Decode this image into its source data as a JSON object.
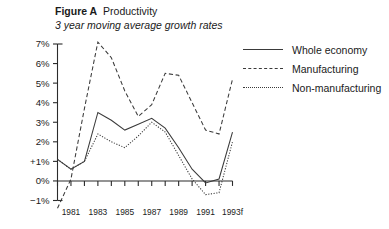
{
  "figure": {
    "label": "Figure A",
    "title": "Productivity",
    "subtitle": "3 year moving average growth rates"
  },
  "legend": [
    {
      "label": "Whole economy",
      "style": "solid"
    },
    {
      "label": "Manufacturing",
      "style": "dashed"
    },
    {
      "label": "Non-manufacturing",
      "style": "dotted"
    }
  ],
  "axes": {
    "y_ticks": [
      "7%",
      "6%",
      "5%",
      "4%",
      "3%",
      "2%",
      "+1%",
      "0%",
      "−1%"
    ],
    "x_ticks": [
      "1981",
      "1983",
      "1985",
      "1987",
      "1989",
      "1991",
      "1993f"
    ]
  },
  "chart_data": {
    "type": "line",
    "title": "Productivity",
    "subtitle": "3 year moving average growth rates",
    "xlabel": "",
    "ylabel": "",
    "ylim": [
      -1,
      7
    ],
    "xlim": [
      1980,
      1993
    ],
    "grid": false,
    "legend_position": "top-right",
    "yticks": [
      -1,
      0,
      1,
      2,
      3,
      4,
      5,
      6,
      7
    ],
    "ytick_labels": [
      "−1%",
      "0%",
      "+1%",
      "2%",
      "3%",
      "4%",
      "5%",
      "6%",
      "7%"
    ],
    "x": [
      1980,
      1981,
      1982,
      1983,
      1984,
      1985,
      1986,
      1987,
      1988,
      1989,
      1990,
      1991,
      1992,
      1993
    ],
    "xtick_values": [
      1981,
      1983,
      1985,
      1987,
      1989,
      1991,
      1993
    ],
    "xtick_labels": [
      "1981",
      "1983",
      "1985",
      "1987",
      "1989",
      "1991",
      "1993f"
    ],
    "series": [
      {
        "name": "Whole economy",
        "style": "solid",
        "values": [
          1.1,
          0.6,
          1.0,
          3.5,
          3.1,
          2.6,
          2.9,
          3.2,
          2.7,
          1.7,
          0.6,
          -0.1,
          0.1,
          2.5
        ]
      },
      {
        "name": "Manufacturing",
        "style": "dashed",
        "values": [
          -1.4,
          0.1,
          3.7,
          7.1,
          6.3,
          4.6,
          3.3,
          3.9,
          5.5,
          5.4,
          4.0,
          2.6,
          2.4,
          5.2
        ]
      },
      {
        "name": "Non-manufacturing",
        "style": "dotted",
        "values": [
          1.1,
          0.6,
          1.0,
          2.4,
          2.0,
          1.7,
          2.3,
          3.0,
          2.5,
          1.3,
          0.1,
          -0.7,
          -0.6,
          2.0
        ]
      }
    ]
  }
}
